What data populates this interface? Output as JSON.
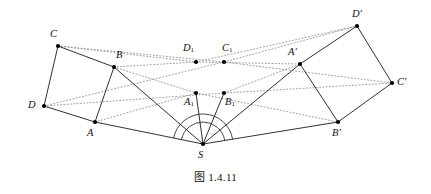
{
  "figure": {
    "caption": "图 1.4.11",
    "caption_prefix": "图",
    "caption_number": "1.4.11",
    "background_color": "#ffffff",
    "stroke_color": "#1a1a1a",
    "dotted_color": "#8a8a8a",
    "point_color": "#000000",
    "width": 431,
    "height": 194
  },
  "points": [
    {
      "id": "C",
      "label": "C",
      "sub": "",
      "prime": false,
      "x": 58,
      "y": 46,
      "lx": 50,
      "ly": 29
    },
    {
      "id": "B",
      "label": "B",
      "sub": "",
      "prime": false,
      "x": 114,
      "y": 67,
      "lx": 116,
      "ly": 50
    },
    {
      "id": "D",
      "label": "D",
      "sub": "",
      "prime": false,
      "x": 44,
      "y": 106,
      "lx": 28,
      "ly": 100
    },
    {
      "id": "A",
      "label": "A",
      "sub": "",
      "prime": false,
      "x": 95,
      "y": 122,
      "lx": 87,
      "ly": 128
    },
    {
      "id": "S",
      "label": "S",
      "sub": "",
      "prime": false,
      "x": 203,
      "y": 144,
      "lx": 198,
      "ly": 150
    },
    {
      "id": "A1",
      "label": "A",
      "sub": "1",
      "prime": false,
      "x": 196,
      "y": 93,
      "lx": 184,
      "ly": 97
    },
    {
      "id": "B1",
      "label": "B",
      "sub": "1",
      "prime": false,
      "x": 224,
      "y": 93,
      "lx": 225,
      "ly": 97
    },
    {
      "id": "D1",
      "label": "D",
      "sub": "1",
      "prime": false,
      "x": 196,
      "y": 62,
      "lx": 183,
      "ly": 43
    },
    {
      "id": "C1",
      "label": "C",
      "sub": "1",
      "prime": false,
      "x": 224,
      "y": 62,
      "lx": 222,
      "ly": 43
    },
    {
      "id": "Ap",
      "label": "A",
      "sub": "",
      "prime": true,
      "x": 300,
      "y": 64,
      "lx": 288,
      "ly": 47
    },
    {
      "id": "Dp",
      "label": "D",
      "sub": "",
      "prime": true,
      "x": 357,
      "y": 26,
      "lx": 352,
      "ly": 9
    },
    {
      "id": "Cp",
      "label": "C",
      "sub": "",
      "prime": true,
      "x": 392,
      "y": 83,
      "lx": 397,
      "ly": 77
    },
    {
      "id": "Bp",
      "label": "B",
      "sub": "",
      "prime": true,
      "x": 338,
      "y": 122,
      "lx": 332,
      "ly": 128
    }
  ],
  "solid_edges": [
    {
      "name": "edge-D-C",
      "from": "D",
      "to": "C"
    },
    {
      "name": "edge-C-B",
      "from": "C",
      "to": "B"
    },
    {
      "name": "edge-B-A",
      "from": "B",
      "to": "A"
    },
    {
      "name": "edge-A-D",
      "from": "A",
      "to": "D"
    },
    {
      "name": "edge-Ap-Dp",
      "from": "Ap",
      "to": "Dp"
    },
    {
      "name": "edge-Dp-Cp",
      "from": "Dp",
      "to": "Cp"
    },
    {
      "name": "edge-Cp-Bp",
      "from": "Cp",
      "to": "Bp"
    },
    {
      "name": "edge-Bp-Ap",
      "from": "Bp",
      "to": "Ap"
    },
    {
      "name": "ray-S-A",
      "from": "S",
      "to": "A"
    },
    {
      "name": "ray-S-B",
      "from": "S",
      "to": "B"
    },
    {
      "name": "ray-S-A1",
      "from": "S",
      "to": "A1"
    },
    {
      "name": "ray-S-B1",
      "from": "S",
      "to": "B1"
    },
    {
      "name": "ray-S-Ap",
      "from": "S",
      "to": "Ap"
    },
    {
      "name": "ray-S-Bp",
      "from": "S",
      "to": "Bp"
    }
  ],
  "dotted_edges": [
    {
      "name": "dotted-C-D1-Dp",
      "from": "C",
      "to": "Dp",
      "via": "D1"
    },
    {
      "name": "dotted-D-C1-Cp",
      "from": "D",
      "to": "Cp",
      "via": "C1"
    },
    {
      "name": "dotted-C-C1",
      "from": "C",
      "to": "C1"
    },
    {
      "name": "dotted-C1-Dp",
      "from": "C1",
      "to": "Dp"
    },
    {
      "name": "dotted-B-D1",
      "from": "B",
      "to": "D1"
    },
    {
      "name": "dotted-D1-Ap",
      "from": "D1",
      "to": "Ap"
    },
    {
      "name": "dotted-D-B1",
      "from": "D",
      "to": "B1"
    },
    {
      "name": "dotted-B1-Cp",
      "from": "B1",
      "to": "Cp"
    },
    {
      "name": "dotted-A-A1",
      "from": "A",
      "to": "A1"
    },
    {
      "name": "dotted-A1-Bp",
      "from": "A1",
      "to": "Bp"
    },
    {
      "name": "dotted-B-A1",
      "from": "B",
      "to": "A1"
    },
    {
      "name": "dotted-B1-Ap",
      "from": "B1",
      "to": "Ap"
    }
  ],
  "angle_arcs": [
    {
      "name": "angle-arc-at-S-outer",
      "vertex": "S",
      "radius": 30
    },
    {
      "name": "angle-arc-at-S-inner",
      "vertex": "S",
      "radius": 22
    }
  ]
}
